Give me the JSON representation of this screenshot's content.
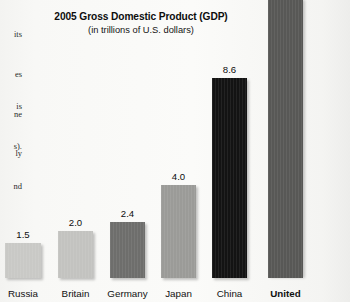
{
  "page": {
    "background_color": "#f6f6f4",
    "bleed_text_left": {
      "top_fragments": [
        "its",
        "es",
        "ne",
        "ly"
      ],
      "bottom_fragments": [
        "is",
        "s).",
        "nd"
      ]
    }
  },
  "chart_data": {
    "type": "bar",
    "title": "2005 Gross Domestic Product (GDP)",
    "subtitle": "(in trillions of U.S. dollars)",
    "xlabel": "",
    "ylabel": "",
    "units": "trillions of U.S. dollars",
    "grid": false,
    "legend": "none",
    "axis_visible": false,
    "ylim": [
      0,
      13
    ],
    "categories": [
      "Russia",
      "Britain",
      "Germany",
      "Japan",
      "China",
      "United States"
    ],
    "values": [
      1.5,
      2.0,
      2.4,
      4.0,
      8.6,
      12.5
    ],
    "value_labels": [
      "1.5",
      "2.0",
      "2.4",
      "4.0",
      "8.6",
      ""
    ],
    "bars": [
      {
        "category": "Russia",
        "label": "Russia",
        "value": 1.5,
        "value_label": "1.5",
        "color": "#c9c9c6",
        "label_bold": false,
        "clipped": false,
        "left_px": 5,
        "width_px": 36,
        "height_px": 35
      },
      {
        "category": "Britain",
        "label": "Britain",
        "value": 2.0,
        "value_label": "2.0",
        "color": "#c3c3c0",
        "label_bold": false,
        "clipped": false,
        "left_px": 58,
        "width_px": 35,
        "height_px": 47
      },
      {
        "category": "Germany",
        "label": "Germany",
        "value": 2.4,
        "value_label": "2.4",
        "color": "#6e6e6c",
        "label_bold": false,
        "clipped": false,
        "left_px": 110,
        "width_px": 35,
        "height_px": 56
      },
      {
        "category": "Japan",
        "label": "Japan",
        "value": 4.0,
        "value_label": "4.0",
        "color": "#9b9b98",
        "label_bold": false,
        "clipped": false,
        "left_px": 161,
        "width_px": 35,
        "height_px": 93
      },
      {
        "category": "China",
        "label": "China",
        "value": 8.6,
        "value_label": "8.6",
        "color": "#131313",
        "label_bold": false,
        "clipped": false,
        "left_px": 212,
        "width_px": 35,
        "height_px": 200
      },
      {
        "category": "United States",
        "label": "United",
        "value": 12.5,
        "value_label": "",
        "color": "#585856",
        "label_bold": true,
        "clipped": true,
        "left_px": 268,
        "width_px": 35,
        "height_px": 278
      }
    ]
  }
}
